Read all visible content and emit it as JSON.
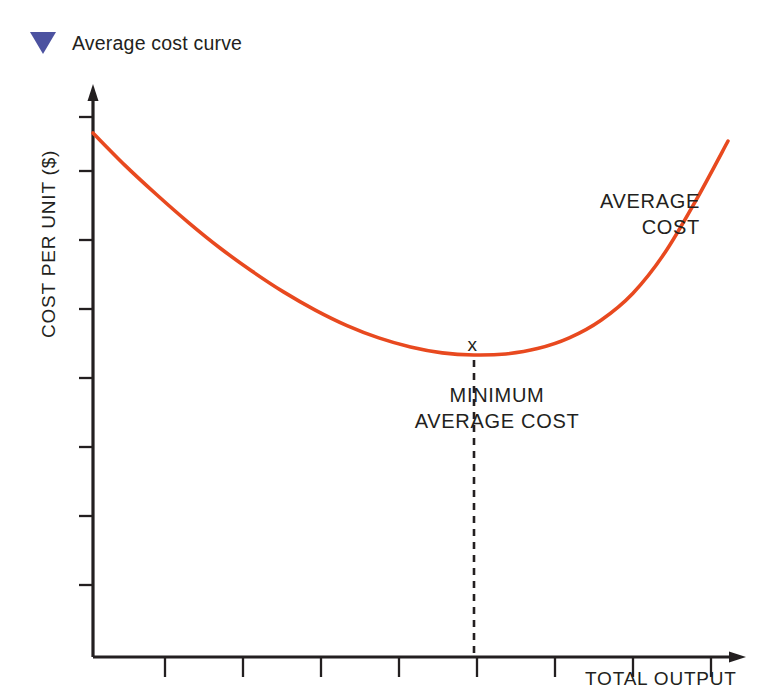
{
  "title": {
    "marker_icon": "triangle-down-icon",
    "marker_color": "#4c52a0",
    "text": "Average cost curve"
  },
  "axes": {
    "y_label": "COST PER UNIT ($)",
    "x_label": "TOTAL OUTPUT",
    "axis_color": "#231f20"
  },
  "annotations": {
    "curve_label_line1": "AVERAGE",
    "curve_label_line2": "COST",
    "minimum_label_line1": "MINIMUM",
    "minimum_label_line2": "AVERAGE COST",
    "minimum_marker": "x"
  },
  "chart_data": {
    "type": "line",
    "title": "Average cost curve",
    "xlabel": "TOTAL OUTPUT",
    "ylabel": "COST PER UNIT ($)",
    "grid": false,
    "legend": null,
    "axis_style": "arrow-axes-with-ticks",
    "xlim": [
      0,
      10
    ],
    "ylim": [
      0,
      10
    ],
    "x_ticks": [
      0,
      1,
      2,
      3,
      4,
      5,
      6,
      7,
      8,
      9
    ],
    "x_tick_labels": [],
    "y_ticks": [
      1,
      2,
      3,
      4,
      5,
      6,
      7,
      8
    ],
    "y_tick_labels": [],
    "series": [
      {
        "name": "AVERAGE COST",
        "color": "#e8491f",
        "x": [
          0.0,
          0.5,
          1.0,
          1.5,
          2.0,
          2.5,
          3.0,
          3.5,
          4.0,
          4.5,
          5.0,
          5.5,
          6.0,
          6.5,
          7.0,
          7.5,
          8.0,
          8.5,
          9.0,
          9.5,
          10.0
        ],
        "y": [
          9.15,
          8.55,
          8.0,
          7.48,
          7.0,
          6.57,
          6.18,
          5.84,
          5.55,
          5.32,
          5.15,
          5.04,
          5.0,
          5.02,
          5.12,
          5.32,
          5.65,
          6.15,
          6.9,
          7.9,
          9.0
        ]
      }
    ],
    "markers": [
      {
        "label": "MINIMUM AVERAGE COST",
        "marker": "x",
        "x": 6.0,
        "y": 5.0,
        "dropline": true,
        "dropline_style": "dashed"
      }
    ]
  }
}
